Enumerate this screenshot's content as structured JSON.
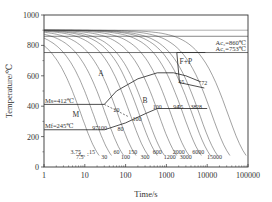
{
  "chart_data": {
    "type": "line",
    "title": "",
    "xlabel": "Time/s",
    "ylabel": "Temperature/℃",
    "xscale": "log",
    "xlim": [
      1,
      100000
    ],
    "ylim": [
      0,
      1000
    ],
    "xticks": [
      1,
      10,
      100,
      1000,
      10000,
      100000
    ],
    "xtick_labels": [
      "1",
      "10",
      "100",
      "1000",
      "10000",
      "100000"
    ],
    "yticks": [
      0,
      200,
      400,
      600,
      800,
      1000
    ],
    "ytick_labels": [
      "0",
      "200",
      "400",
      "600",
      "800",
      "1000"
    ],
    "grid": false,
    "horizontal_lines": [
      {
        "name": "Ac3",
        "label": "Ac₃=860℃",
        "value": 860
      },
      {
        "name": "Ac1",
        "label": "Ac₁=753℃",
        "value": 753
      },
      {
        "name": "Ms",
        "label": "Ms=412℃",
        "value": 412
      },
      {
        "name": "Mf",
        "label": "Mf=245℃",
        "value": 245
      }
    ],
    "regions": [
      {
        "label": "A",
        "x": 25,
        "y": 600
      },
      {
        "label": "B",
        "x": 300,
        "y": 420
      },
      {
        "label": "M",
        "x": 6,
        "y": 330
      },
      {
        "label": "F+P",
        "x": 3000,
        "y": 680
      }
    ],
    "t85_prefix": "t₈₅ :",
    "cooling_curves_t85": [
      3.75,
      7.5,
      15,
      30,
      60,
      100,
      150,
      300,
      600,
      1200,
      2000,
      3000,
      6000,
      15000
    ],
    "t85_labels_upper": [
      "3.75",
      "15",
      "60",
      "150",
      "600",
      "2000",
      "6000"
    ],
    "t85_labels_lower": [
      "7.5",
      "30",
      "100",
      "300",
      "1200",
      "3000",
      "15000"
    ],
    "hardness_annotations": [
      {
        "label": "97",
        "x": 18,
        "y": 245
      },
      {
        "label": "100",
        "x": 27,
        "y": 245
      },
      {
        "label": "80",
        "x": 75,
        "y": 235
      },
      {
        "label": "20",
        "x": 60,
        "y": 365
      },
      {
        "label": "100",
        "x": 190,
        "y": 305
      },
      {
        "label": "100",
        "x": 600,
        "y": 380
      },
      {
        "label": "94",
        "x": 1750,
        "y": 380
      },
      {
        "label": "55",
        "x": 2200,
        "y": 380
      },
      {
        "label": "38",
        "x": 4600,
        "y": 380
      },
      {
        "label": "28",
        "x": 6300,
        "y": 380
      },
      {
        "label": "45",
        "x": 2300,
        "y": 545
      },
      {
        "label": "72",
        "x": 8500,
        "y": 540
      }
    ],
    "bainite_start": [
      [
        30,
        412
      ],
      [
        60,
        500
      ],
      [
        200,
        580
      ],
      [
        600,
        620
      ],
      [
        1500,
        620
      ],
      [
        3000,
        600
      ],
      [
        7000,
        560
      ]
    ],
    "bainite_finish": [
      [
        30,
        245
      ],
      [
        100,
        290
      ],
      [
        300,
        350
      ],
      [
        600,
        385
      ],
      [
        10000,
        385
      ]
    ],
    "ferrite_pearlite_start": [
      [
        1800,
        753
      ],
      [
        9000,
        753
      ]
    ],
    "ferrite_pearlite_finish": [
      [
        2100,
        555
      ],
      [
        8500,
        520
      ]
    ],
    "colors": {
      "axis": "#333333",
      "curve": "#444444",
      "boundary": "#222222"
    }
  }
}
